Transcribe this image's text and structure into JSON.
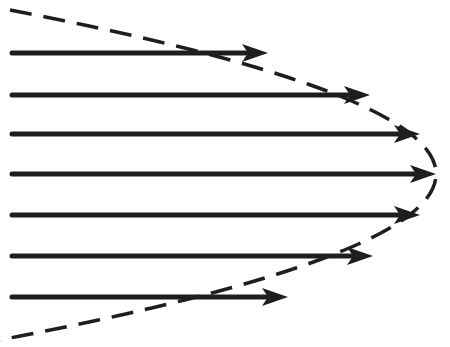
{
  "diagram": {
    "type": "velocity-profile",
    "colors": {
      "background": "#ffffff",
      "arrow": "#1e1e1e",
      "envelope": "#1e1e1e"
    },
    "start_x": 12,
    "arrows": [
      {
        "y": 53,
        "tip_x": 268
      },
      {
        "y": 95,
        "tip_x": 370
      },
      {
        "y": 134,
        "tip_x": 420
      },
      {
        "y": 174,
        "tip_x": 436
      },
      {
        "y": 215,
        "tip_x": 420
      },
      {
        "y": 256,
        "tip_x": 373
      },
      {
        "y": 297,
        "tip_x": 288
      }
    ],
    "envelope": {
      "style": "dashed",
      "top": {
        "x": 10,
        "y": 10
      },
      "vertex": {
        "x": 436,
        "y": 174
      },
      "bottom": {
        "x": 10,
        "y": 340
      }
    }
  }
}
